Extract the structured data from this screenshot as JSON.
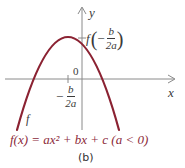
{
  "diagram": {
    "axes": {
      "x_label": "x",
      "y_label": "y",
      "origin_label": "0"
    },
    "curve": {
      "label": "f",
      "color": "#8b2232",
      "description": "downward-opening parabola"
    },
    "annotations": {
      "vertex_y": {
        "func": "f",
        "paren_open": "(",
        "minus": "−",
        "num": "b",
        "den": "2a",
        "paren_close": ")"
      },
      "vertex_x": {
        "minus": "−",
        "num": "b",
        "den": "2a"
      }
    },
    "caption": "f(x) = ax² + bx + c (a < 0)",
    "sublabel": "(b)",
    "colors": {
      "axis": "#7a7a7a",
      "curve": "#8b2232",
      "caption": "#8c2a3a",
      "text": "#3a3a3a"
    }
  }
}
